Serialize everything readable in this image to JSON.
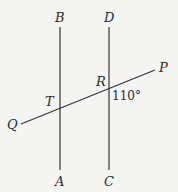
{
  "diagram": {
    "type": "geometry",
    "labels": {
      "B": "B",
      "D": "D",
      "P": "P",
      "R": "R",
      "T": "T",
      "Q": "Q",
      "A": "A",
      "C": "C"
    },
    "angle_label": "110°",
    "lines": [
      {
        "name": "AB",
        "x1": 60,
        "y1": 27,
        "x2": 60,
        "y2": 170
      },
      {
        "name": "CD",
        "x1": 109,
        "y1": 27,
        "x2": 109,
        "y2": 170
      },
      {
        "name": "QP",
        "x1": 21,
        "y1": 124,
        "x2": 155,
        "y2": 70
      }
    ]
  }
}
